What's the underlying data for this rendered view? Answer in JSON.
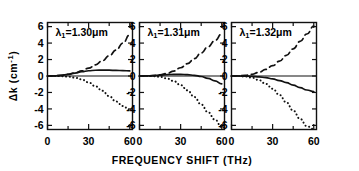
{
  "figure": {
    "background_color": "#ffffff",
    "ink_color": "#111111",
    "xlabel": "FREQUENCY SHIFT (THz)",
    "ylabel_main": "Δk (cm",
    "ylabel_exponent": "-1",
    "ylabel_close": ")",
    "ylabel_full": "Δk (cm-1)"
  },
  "chart_data": {
    "type": "line",
    "title": "",
    "xlabel": "FREQUENCY SHIFT (THz)",
    "ylabel": "Δk (cm^-1)",
    "xlim": [
      0,
      62
    ],
    "ylim": [
      -6.5,
      6.5
    ],
    "xticks": [
      0,
      30,
      60
    ],
    "xticklabels": [
      "0",
      "30",
      "60"
    ],
    "xminorticks": [
      15,
      45
    ],
    "yticks": [
      6,
      4,
      2,
      0,
      -2,
      -4,
      -6
    ],
    "yticklabels": [
      "6",
      "4",
      "2",
      "0",
      "-2",
      "-4",
      "-6"
    ],
    "grid": false,
    "legend": "none",
    "panels": [
      {
        "id": "panel-1",
        "annotation": "λ₁=1.30μm",
        "annotation_symbol": "λ",
        "annotation_subscript": "1",
        "annotation_value": "=1.30μm",
        "series": [
          {
            "name": "dashed",
            "style": "dashed",
            "x": [
              0,
              5,
              10,
              15,
              20,
              25,
              30,
              35,
              40,
              45,
              50,
              55,
              60
            ],
            "y": [
              0.0,
              0.02,
              0.08,
              0.2,
              0.38,
              0.62,
              0.95,
              1.35,
              1.85,
              2.45,
              3.15,
              4.0,
              5.0
            ]
          },
          {
            "name": "solid",
            "style": "solid",
            "x": [
              0,
              5,
              10,
              15,
              20,
              25,
              30,
              35,
              40,
              45,
              50,
              55,
              60
            ],
            "y": [
              0.0,
              0.02,
              0.08,
              0.2,
              0.36,
              0.52,
              0.64,
              0.7,
              0.72,
              0.71,
              0.68,
              0.65,
              0.62
            ]
          },
          {
            "name": "dotted",
            "style": "dotted",
            "x": [
              0,
              5,
              10,
              15,
              20,
              25,
              30,
              35,
              40,
              45,
              50,
              55,
              60
            ],
            "y": [
              0.0,
              0.0,
              -0.02,
              -0.08,
              -0.2,
              -0.42,
              -0.78,
              -1.25,
              -1.8,
              -2.45,
              -3.1,
              -3.65,
              -4.15
            ]
          }
        ]
      },
      {
        "id": "panel-2",
        "annotation": "λ₁=1.31μm",
        "annotation_symbol": "λ",
        "annotation_subscript": "1",
        "annotation_value": "=1.31μm",
        "series": [
          {
            "name": "dashed",
            "style": "dashed",
            "x": [
              0,
              5,
              10,
              15,
              20,
              25,
              30,
              35,
              40,
              45,
              50,
              55,
              60
            ],
            "y": [
              0.0,
              0.01,
              0.05,
              0.14,
              0.32,
              0.6,
              1.0,
              1.5,
              2.1,
              2.8,
              3.55,
              4.3,
              5.1
            ]
          },
          {
            "name": "solid",
            "style": "solid",
            "x": [
              0,
              5,
              10,
              15,
              20,
              25,
              30,
              35,
              40,
              45,
              50,
              55,
              60
            ],
            "y": [
              0.0,
              0.01,
              0.04,
              0.1,
              0.17,
              0.2,
              0.2,
              0.16,
              0.08,
              -0.06,
              -0.28,
              -0.6,
              -0.95
            ]
          },
          {
            "name": "dotted",
            "style": "dotted",
            "x": [
              0,
              5,
              10,
              15,
              20,
              25,
              30,
              35,
              40,
              45,
              50,
              55,
              60
            ],
            "y": [
              0.0,
              0.0,
              -0.02,
              -0.1,
              -0.3,
              -0.62,
              -1.1,
              -1.75,
              -2.55,
              -3.45,
              -4.4,
              -5.3,
              -6.2
            ]
          }
        ]
      },
      {
        "id": "panel-3",
        "annotation": "λ₁=1.32μm",
        "annotation_symbol": "λ",
        "annotation_subscript": "1",
        "annotation_value": "=1.32μm",
        "series": [
          {
            "name": "dashed",
            "style": "dashed",
            "x": [
              0,
              5,
              10,
              15,
              20,
              25,
              30,
              35,
              40,
              45,
              50,
              55,
              60
            ],
            "y": [
              0.0,
              0.02,
              0.08,
              0.2,
              0.45,
              0.8,
              1.25,
              1.8,
              2.5,
              3.3,
              4.2,
              5.1,
              6.05
            ]
          },
          {
            "name": "solid",
            "style": "solid",
            "x": [
              0,
              5,
              10,
              15,
              20,
              25,
              30,
              35,
              40,
              45,
              50,
              55,
              60
            ],
            "y": [
              0.0,
              0.0,
              -0.01,
              -0.04,
              -0.1,
              -0.2,
              -0.35,
              -0.55,
              -0.8,
              -1.1,
              -1.42,
              -1.7,
              -1.9
            ]
          },
          {
            "name": "dotted",
            "style": "dotted",
            "x": [
              0,
              5,
              10,
              15,
              20,
              25,
              30,
              35,
              40,
              45,
              50,
              55,
              60
            ],
            "y": [
              0.0,
              -0.01,
              -0.06,
              -0.2,
              -0.5,
              -0.95,
              -1.55,
              -2.3,
              -3.2,
              -4.2,
              -5.2,
              -6.1,
              -6.45
            ]
          }
        ]
      }
    ]
  }
}
